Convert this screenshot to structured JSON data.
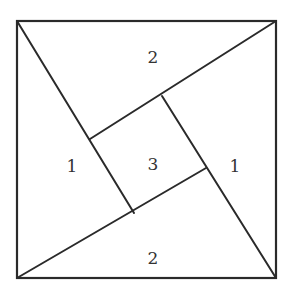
{
  "diagram": {
    "type": "square-dissection",
    "outer_square": {
      "top_left": [
        17,
        21
      ],
      "top_right": [
        276,
        21
      ],
      "bottom_right": [
        276,
        278
      ],
      "bottom_left": [
        17,
        278
      ]
    },
    "inner_square": {
      "top": [
        162,
        96
      ],
      "right": [
        206,
        168
      ],
      "bottom": [
        134,
        213
      ],
      "left": [
        90,
        139
      ]
    },
    "segments": [
      {
        "name": "top-left-to-bottom-inner",
        "from": [
          17,
          21
        ],
        "to": [
          134,
          213
        ]
      },
      {
        "name": "top-right-to-left-inner",
        "from": [
          276,
          21
        ],
        "to": [
          90,
          139
        ]
      },
      {
        "name": "bottom-right-to-top-inner",
        "from": [
          276,
          278
        ],
        "to": [
          162,
          96
        ]
      },
      {
        "name": "bottom-left-to-right-inner",
        "from": [
          17,
          278
        ],
        "to": [
          206,
          168
        ]
      }
    ],
    "labels": [
      {
        "name": "region-top",
        "text": "2",
        "x": 153,
        "y": 57
      },
      {
        "name": "region-left",
        "text": "1",
        "x": 72,
        "y": 166
      },
      {
        "name": "region-center",
        "text": "3",
        "x": 153,
        "y": 164
      },
      {
        "name": "region-right",
        "text": "1",
        "x": 235,
        "y": 166
      },
      {
        "name": "region-bottom",
        "text": "2",
        "x": 153,
        "y": 258
      }
    ],
    "colors": {
      "line": "#2a2a2a",
      "label": "#333333",
      "background": "#ffffff"
    }
  }
}
